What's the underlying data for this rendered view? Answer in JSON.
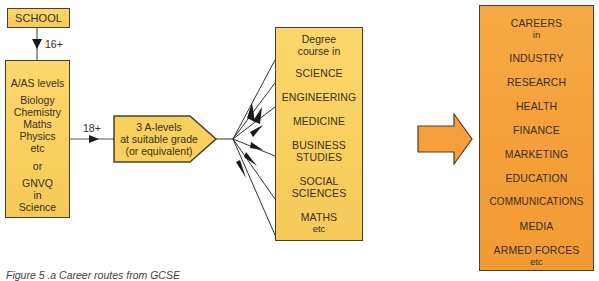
{
  "school": {
    "label": "SCHOOL"
  },
  "arrow_16": {
    "label": "16+"
  },
  "a_as_box": {
    "heading": "A/AS levels",
    "subjects": [
      "Biology",
      "Chemistry",
      "Maths",
      "Physics",
      "etc"
    ],
    "or": "or",
    "gnvq": [
      "GNVQ",
      "in",
      "Science"
    ]
  },
  "arrow_18": {
    "label": "18+"
  },
  "requirement": {
    "lines": [
      "3 A-levels",
      "at suitable grade",
      "(or equivalent)"
    ]
  },
  "degree_box": {
    "heading": [
      "Degree",
      "course in"
    ],
    "courses": [
      "SCIENCE",
      "ENGINEERING",
      "MEDICINE",
      "BUSINESS STUDIES",
      "SOCIAL SCIENCES",
      "MATHS"
    ],
    "business_lines": [
      "BUSINESS",
      "STUDIES"
    ],
    "social_lines": [
      "SOCIAL",
      "SCIENCES"
    ],
    "etc": "etc"
  },
  "careers_box": {
    "heading": [
      "CAREERS",
      "in"
    ],
    "careers": [
      "INDUSTRY",
      "RESEARCH",
      "HEALTH",
      "FINANCE",
      "MARKETING",
      "EDUCATION",
      "COMMUNICATIONS",
      "MEDIA",
      "ARMED FORCES"
    ],
    "etc": "etc"
  },
  "caption": "Figure 5 .a  Career routes from GCSE",
  "colors": {
    "yellow_fill": "#f9cf5e",
    "orange_fill": "#f5a03a",
    "outline": "#4a3f2c",
    "text": "#3a3020"
  }
}
